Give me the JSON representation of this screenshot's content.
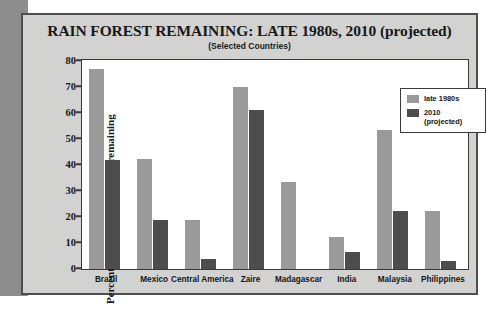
{
  "chart_data": {
    "type": "bar",
    "title": "RAIN FOREST REMAINING: LATE 1980s, 2010 (projected)",
    "subtitle": "(Selected Countries)",
    "xlabel": "",
    "ylabel": "Percent of original rain forest remaining",
    "ylim": [
      0,
      80
    ],
    "yticks": [
      0,
      10,
      20,
      30,
      40,
      50,
      60,
      70,
      80
    ],
    "grid": false,
    "legend_position": "top-right",
    "categories": [
      "Brazil",
      "Mexico",
      "Central America",
      "Zaire",
      "Madagascar",
      "India",
      "Malaysia",
      "Philippines"
    ],
    "series": [
      {
        "name": "late 1980s",
        "color": "#9a9a9a",
        "values": [
          77,
          42.5,
          19,
          70,
          33.5,
          12.5,
          53.5,
          22.5
        ]
      },
      {
        "name": "2010 (projected)",
        "color": "#4d4d4d",
        "values": [
          42,
          19,
          4,
          61,
          null,
          6.5,
          22.5,
          3
        ]
      }
    ]
  },
  "legend": {
    "entries": [
      {
        "label_line1": "late 1980s",
        "label_line2": ""
      },
      {
        "label_line1": "2010",
        "label_line2": "(projected)"
      }
    ]
  },
  "colors": {
    "series_late_1980s": "#9a9a9a",
    "series_2010": "#4d4d4d",
    "panel_background": "#d2d2d0",
    "plot_background": "#ffffff",
    "axis": "#3a3a3a",
    "left_band": "#8d8d8d"
  }
}
